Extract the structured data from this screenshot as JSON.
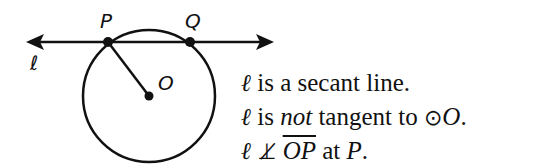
{
  "diagram": {
    "line_label": "ℓ",
    "point_labels": {
      "P": "P",
      "Q": "Q",
      "O": "O"
    },
    "colors": {
      "stroke": "#111111",
      "background": "#ffffff"
    }
  },
  "statements": [
    {
      "prefix": "ℓ",
      "text": " is a secant line."
    },
    {
      "prefix": "ℓ",
      "pre": " is ",
      "emph": "not",
      "post": " tangent to ",
      "symbol": "⊙",
      "circle": "O",
      "end": "."
    },
    {
      "prefix": "ℓ",
      "perp": "⊥̸",
      "segment": "OP",
      "post": " at ",
      "point": "P",
      "end": "."
    }
  ]
}
